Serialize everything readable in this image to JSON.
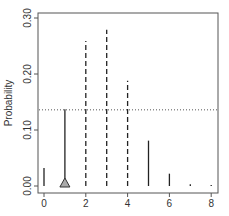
{
  "chart_data": {
    "type": "bar",
    "title": "",
    "xlabel": "",
    "ylabel": "Probability",
    "xlim": [
      0,
      8
    ],
    "ylim": [
      0,
      0.3
    ],
    "x_ticks": [
      0,
      2,
      4,
      6,
      8
    ],
    "y_ticks": [
      "0.00",
      "0.10",
      "0.20",
      "0.30"
    ],
    "categories": [
      0,
      1,
      2,
      3,
      4,
      5,
      6,
      7,
      8
    ],
    "values": [
      0.032,
      0.137,
      0.259,
      0.279,
      0.188,
      0.081,
      0.022,
      0.003,
      0.0002
    ],
    "line_styles": [
      "solid",
      "solid",
      "dashed",
      "dashed",
      "dashed",
      "solid",
      "solid",
      "solid",
      "solid"
    ],
    "reference_line": {
      "y": 0.136,
      "style": "dotted"
    },
    "marker": {
      "x": 1,
      "shape": "triangle",
      "fill": "#aaaaaa"
    },
    "grid": false,
    "legend": null
  },
  "colors": {
    "bars": "#222222",
    "axis": "#555555",
    "reference_line": "#555555",
    "marker_fill": "#aaaaaa"
  }
}
